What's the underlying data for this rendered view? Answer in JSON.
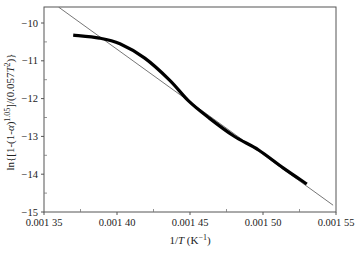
{
  "chart_data": {
    "type": "line",
    "title": "",
    "xlabel": "1/T (K⁻¹)",
    "ylabel": "ln{[1-(1-α)^1.05]/(0.057T²)}",
    "xlim": [
      0.00135,
      0.00155
    ],
    "ylim": [
      -15,
      -9.5
    ],
    "x_ticks": [
      "0.001 35",
      "0.001 40",
      "0.001 45",
      "0.001 50",
      "0.001 55"
    ],
    "x_tick_values": [
      0.00135,
      0.0014,
      0.00145,
      0.0015,
      0.00155
    ],
    "y_ticks": [
      "-10",
      "-11",
      "-12",
      "-13",
      "-14",
      "-15"
    ],
    "y_tick_values": [
      -10,
      -11,
      -12,
      -13,
      -14,
      -15
    ],
    "grid": false,
    "legend": null,
    "series": [
      {
        "name": "experimental",
        "style": "thick black curve",
        "x": [
          0.00137,
          0.001388,
          0.001402,
          0.001419,
          0.001436,
          0.001449,
          0.001463,
          0.00148,
          0.001497,
          0.001514,
          0.00153
        ],
        "y": [
          -10.32,
          -10.4,
          -10.55,
          -10.93,
          -11.51,
          -12.06,
          -12.51,
          -12.99,
          -13.36,
          -13.84,
          -14.26
        ]
      },
      {
        "name": "linear fit",
        "style": "thin gray line",
        "x": [
          0.00136,
          0.001548
        ],
        "y": [
          -9.58,
          -14.82
        ]
      }
    ]
  }
}
